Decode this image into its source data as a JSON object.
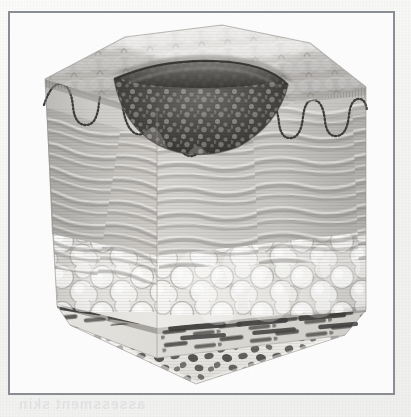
{
  "document": {
    "background_color": "#f6f6f5",
    "frame_color": "#8a8d93",
    "frame_fill": "#fdfdfd",
    "caption": ""
  },
  "bleed_through_text": {
    "top_line": "wound bed yellow",
    "mid_line": "tissue",
    "low_line": "the wound",
    "bottom_line": "assessment skin"
  },
  "figure": {
    "style": "grayscale medical line and tone illustration",
    "projection": "three-dimensional cut block, viewed from above-front",
    "layers": [
      {
        "id": "epidermis",
        "label": "Epidermis",
        "order": 1,
        "description": "Quilted dimpled outer surface on top face of the block",
        "tone": "#d8d6d2"
      },
      {
        "id": "dermal-epidermal-junction",
        "label": "Dermal-epidermal junction (rete ridges)",
        "order": 2,
        "description": "Stippled wavy line running across the front and side faces",
        "tone": "#4a4a4a"
      },
      {
        "id": "dermis",
        "label": "Dermis",
        "order": 3,
        "description": "Horizontal wavy collagen fibre bundles",
        "tone": "#c8c6c2"
      },
      {
        "id": "subcutaneous-fat",
        "label": "Subcutaneous fat",
        "order": 4,
        "description": "Rounded adipose lobules",
        "tone": "#e4e2de"
      },
      {
        "id": "muscle",
        "label": "Muscle",
        "order": 5,
        "description": "Dark elongated striated fibre bands",
        "tone": "#5d5a56"
      },
      {
        "id": "bone",
        "label": "Bone",
        "order": 6,
        "description": "Trabecular cancellous bone wedge at the base",
        "tone": "#efeeea"
      }
    ],
    "wound": {
      "label": "Full-thickness wound / pressure ulcer",
      "location": "upper centre of the block",
      "description": "Open crater breaching epidermis and dermis, undermined edges, dark granular necrotic base",
      "tone": "#3a3a3a"
    },
    "palette": {
      "ink": "#4a4a4a",
      "mid_tone": "#b9b7b3",
      "light_tone": "#eceae6",
      "dark_tone": "#3a3a3a",
      "page": "#f6f6f5"
    }
  }
}
